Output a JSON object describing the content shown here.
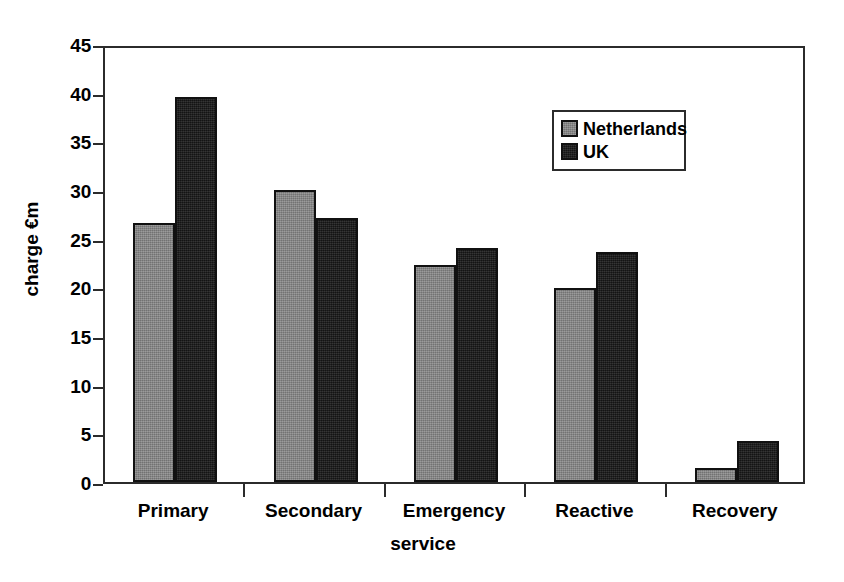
{
  "chart_data": {
    "type": "bar",
    "title": "",
    "xlabel": "service",
    "ylabel": "charge €m",
    "categories": [
      "Primary",
      "Secondary",
      "Emergency",
      "Reactive",
      "Recovery"
    ],
    "series": [
      {
        "name": "Netherlands",
        "color": "#808080",
        "values": [
          26.6,
          30.0,
          22.3,
          19.9,
          1.4
        ]
      },
      {
        "name": "UK",
        "color": "#1c1c1c",
        "values": [
          39.6,
          27.1,
          24.0,
          23.6,
          4.2
        ]
      }
    ],
    "ylim": [
      0,
      45
    ],
    "ytick_labels": [
      "0",
      "5",
      "10",
      "15",
      "20",
      "25",
      "30",
      "35",
      "40",
      "45"
    ],
    "ytick_values": [
      0,
      5,
      10,
      15,
      20,
      25,
      30,
      35,
      40,
      45
    ],
    "ytick_step": 5,
    "grid": false,
    "legend_position": "upper-right-inside",
    "axis_color": "#2b2b2b",
    "background_color": "#ffffff"
  }
}
